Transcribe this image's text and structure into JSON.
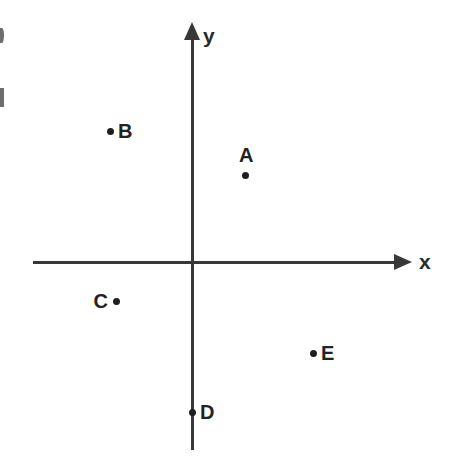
{
  "figure": {
    "width": 460,
    "height": 460,
    "background_color": "#ffffff",
    "axis_color": "#383838",
    "point_color": "#1e1e1e",
    "label_color": "#222222"
  },
  "axes": {
    "x": {
      "label": "x",
      "label_x": 425,
      "label_y": 262,
      "start_x": 33,
      "end_x": 412,
      "y": 262,
      "arrow": "right",
      "arrow_name": "arrow-right-icon"
    },
    "y": {
      "label": "y",
      "label_x": 210,
      "label_y": 38,
      "start_y": 450,
      "end_y": 22,
      "x": 193,
      "arrow": "up",
      "arrow_name": "arrow-up-icon"
    },
    "origin": {
      "x": 193,
      "y": 262
    }
  },
  "chart_data": {
    "type": "scatter",
    "xlabel": "x",
    "ylabel": "y",
    "grid": false,
    "legend": false,
    "origin_px": {
      "x": 193,
      "y": 262
    },
    "xlim": [
      -160,
      220
    ],
    "ylim": [
      -190,
      240
    ],
    "points": [
      {
        "label": "A",
        "px": 245,
        "py": 175,
        "x": 52,
        "y": 87,
        "quadrant": "I",
        "label_position": "above"
      },
      {
        "label": "B",
        "px": 110,
        "py": 131,
        "x": -83,
        "y": 131,
        "quadrant": "II",
        "label_position": "right"
      },
      {
        "label": "C",
        "px": 116,
        "py": 301,
        "x": -77,
        "y": -39,
        "quadrant": "III",
        "label_position": "left"
      },
      {
        "label": "D",
        "px": 192,
        "py": 412,
        "x": -1,
        "y": -150,
        "quadrant": "on y-axis",
        "label_position": "right"
      },
      {
        "label": "E",
        "px": 313,
        "py": 353,
        "x": 120,
        "y": -91,
        "quadrant": "IV",
        "label_position": "right"
      }
    ]
  },
  "edge_artifacts": [
    {
      "name": "clipped-glyph-top",
      "x": 0,
      "y": 28
    },
    {
      "name": "clipped-glyph-lower",
      "x": 0,
      "y": 88
    }
  ]
}
